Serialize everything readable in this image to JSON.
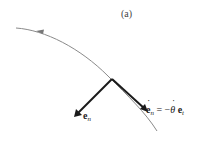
{
  "figure": {
    "caption": "(a)",
    "labels": {
      "normal_vector": {
        "symbol": "e",
        "subscript": "n"
      },
      "derivative_equation": {
        "lhs_symbol": "e",
        "lhs_subscript": "n",
        "equals": "=",
        "minus": "−",
        "theta": "θ",
        "rhs_symbol": "e",
        "rhs_subscript": "t"
      }
    },
    "colors": {
      "curve": "#8a8a8a",
      "vectors": "#1a1a1a",
      "text": "#222222"
    },
    "elements": {
      "curve": "curved path with direction arrow pointing left",
      "vector_e_n": "unit normal vector",
      "vector_e_n_dot": "time derivative of unit normal"
    }
  }
}
